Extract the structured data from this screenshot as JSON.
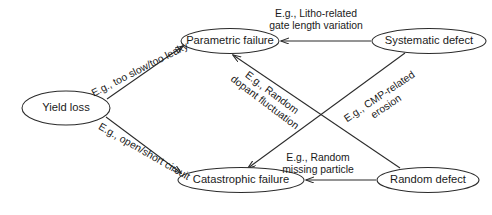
{
  "diagram": {
    "background_color": "#ffffff",
    "stroke_color": "#2b2b2b",
    "text_color": "#1a1a1a",
    "nodes": [
      {
        "id": "yield-loss",
        "label": "Yield loss",
        "cx": 66,
        "cy": 108,
        "rx": 44,
        "ry": 17
      },
      {
        "id": "parametric-failure",
        "label": "Parametric failure",
        "cx": 230,
        "cy": 41,
        "rx": 49,
        "ry": 12.5
      },
      {
        "id": "systematic-defect",
        "label": "Systematic defect",
        "cx": 429,
        "cy": 41,
        "rx": 57,
        "ry": 12.5
      },
      {
        "id": "catastrophic-failure",
        "label": "Catastrophic failure",
        "cx": 241,
        "cy": 180,
        "rx": 63,
        "ry": 12.5
      },
      {
        "id": "random-defect",
        "label": "Random defect",
        "cx": 428,
        "cy": 180,
        "rx": 51,
        "ry": 12.5
      }
    ],
    "edges": [
      {
        "id": "yield-to-parametric",
        "from": "yield-loss",
        "to": "parametric-failure",
        "label_lines": [
          "E.g., too slow/too leaky"
        ],
        "label_x": 140,
        "label_y": 70,
        "label_rotation": -27,
        "x1": 107,
        "y1": 99,
        "x2": 183,
        "y2": 46
      },
      {
        "id": "yield-to-catastrophic",
        "from": "yield-loss",
        "to": "catastrophic-failure",
        "label_lines": [
          "E.g., open/short circuit"
        ],
        "label_x": 144,
        "label_y": 152,
        "label_rotation": 30,
        "x1": 106,
        "y1": 117,
        "x2": 181,
        "y2": 173
      },
      {
        "id": "systematic-to-parametric",
        "from": "systematic-defect",
        "to": "parametric-failure",
        "label_lines": [
          "E.g., Litho-related",
          "gate length variation"
        ],
        "label_x": 316,
        "label_y": 20,
        "label_rotation": 0,
        "x1": 371,
        "y1": 41,
        "x2": 281,
        "y2": 41
      },
      {
        "id": "random-to-catastrophic",
        "from": "random-defect",
        "to": "catastrophic-failure",
        "label_lines": [
          "E.g., Random",
          "missing particle"
        ],
        "label_x": 318,
        "label_y": 164,
        "label_rotation": 0,
        "x1": 376,
        "y1": 180,
        "x2": 306,
        "y2": 180
      },
      {
        "id": "random-to-parametric",
        "from": "random-defect",
        "to": "parametric-failure",
        "label_lines": [
          "E.g., Random",
          "dopant fluctuation"
        ],
        "label_x": 268,
        "label_y": 98,
        "label_rotation": 37,
        "x1": 400,
        "y1": 168,
        "x2": 233,
        "y2": 55
      },
      {
        "id": "systematic-to-catastrophic",
        "from": "systematic-defect",
        "to": "catastrophic-failure",
        "label_lines": [
          "E.g., CMP-related",
          "erosion"
        ],
        "label_x": 383,
        "label_y": 102,
        "label_rotation": -34,
        "x1": 405,
        "y1": 53,
        "x2": 248,
        "y2": 168
      }
    ]
  }
}
